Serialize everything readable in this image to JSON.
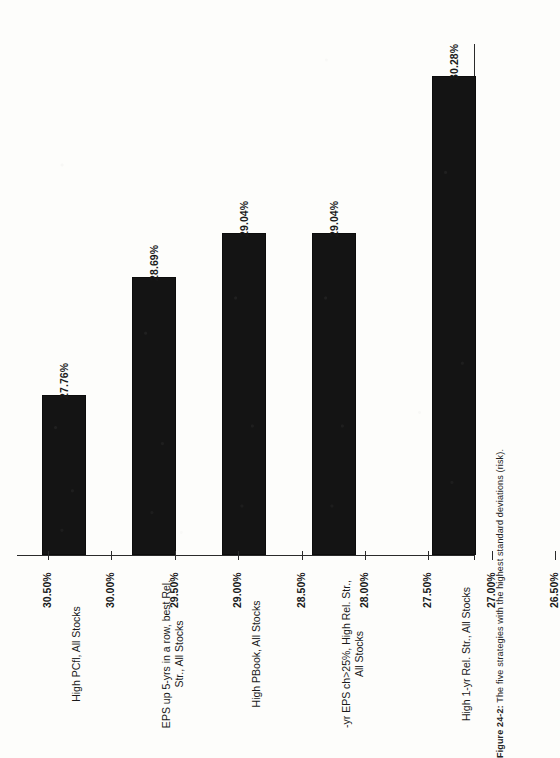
{
  "figure": {
    "caption_label": "Figure 24-2:",
    "caption_text": "The five strategies with the highest standard deviations (risk)."
  },
  "chart_data": {
    "type": "bar",
    "title": "",
    "xlabel": "",
    "ylabel": "",
    "orientation": "vertical-rotated-90ccw",
    "grid": false,
    "legend": null,
    "ylim": [
      26.5,
      30.5
    ],
    "ytick_step": 0.5,
    "categories": [
      "High PCfl, All Stocks",
      "EPS up 5-yrs in a row, best Rel.\nStr., All Stocks",
      "High PBook, All Stocks",
      "-yr EPS ch>25%, High Rel. Str.,\nAll Stocks",
      "High 1-yr Rel. Str., All Stocks"
    ],
    "values": [
      27.76,
      28.69,
      29.04,
      29.04,
      30.28
    ],
    "value_labels": [
      "27.76%",
      "28.69%",
      "29.04%",
      "29.04%",
      "30.28%"
    ],
    "tick_labels": [
      "26.50%",
      "27.00%",
      "27.50%",
      "28.00%",
      "28.50%",
      "29.00%",
      "29.50%",
      "30.00%",
      "30.50%"
    ],
    "tick_values": [
      26.5,
      27.0,
      27.5,
      28.0,
      28.5,
      29.0,
      29.5,
      30.0,
      30.5
    ],
    "bar_color": "#141414",
    "axis_color": "#2b2b2b"
  }
}
